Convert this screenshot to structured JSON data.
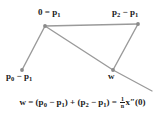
{
  "figure": {
    "type": "vector-geometry-diagram",
    "background_color": "#ffffff",
    "line_color": "#9a9a9a",
    "point_color": "#8a8a8a",
    "text_color": "#1a1a1a"
  },
  "labels": {
    "origin": {
      "text": "0 = p",
      "sub": "1"
    },
    "p2_minus_p1": {
      "lead": "p",
      "sub1": "2",
      "op": " − p",
      "sub2": "1"
    },
    "p0_minus_p1": {
      "lead": "p",
      "sub1": "0",
      "op": " − p",
      "sub2": "1"
    },
    "w": {
      "text": "w"
    }
  },
  "formula": {
    "lhs": "w",
    "equals": " = ",
    "term1_open": "(p",
    "term1_sub1": "0",
    "term1_minus": " − p",
    "term1_sub2": "1",
    "term1_close": ")",
    "plus": " + ",
    "term2_open": "(p",
    "term2_sub1": "2",
    "term2_minus": " − p",
    "term2_sub2": "1",
    "term2_close": ")",
    "equals2": " = ",
    "fraction_numerator": "1",
    "fraction_denominator": "n",
    "rhs_vector": "x",
    "rhs_prime": "″",
    "rhs_arg": "(0)",
    "plain_text": "w = (p0 − p1) + (p2 − p1) = (1/n) x″(0)"
  },
  "geometry": {
    "points": [
      {
        "name": "p1-origin",
        "x": 45,
        "y": 26
      },
      {
        "name": "p2-minus-p1",
        "x": 138,
        "y": 24
      },
      {
        "name": "p0-minus-p1",
        "x": 22,
        "y": 70
      },
      {
        "name": "w",
        "x": 113,
        "y": 70
      }
    ],
    "segments": [
      {
        "name": "top-edge",
        "from": "p1-origin",
        "to": "p2-minus-p1"
      },
      {
        "name": "left-edge",
        "from": "p1-origin",
        "to": "p0-minus-p1"
      },
      {
        "name": "diagonal",
        "from": "p1-origin",
        "to": "w"
      },
      {
        "name": "right-edge",
        "from": "p2-minus-p1",
        "to": "w"
      },
      {
        "name": "extension-ray",
        "from": "w",
        "to_x": 152,
        "to_y": 91
      }
    ]
  }
}
